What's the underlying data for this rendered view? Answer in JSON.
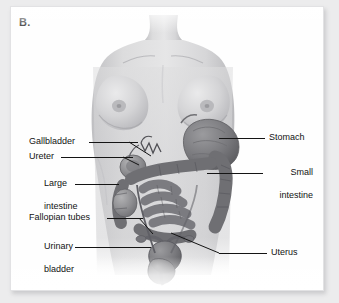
{
  "figure": {
    "panel_letter": "B.",
    "style": "grayscale-medical-illustration",
    "background_color": "#ececed",
    "panel_color": "#fefefe",
    "label_color": "#121212",
    "leader_color": "#141414"
  },
  "labels": {
    "left": [
      {
        "id": "gallbladder",
        "text": "Gallbladder"
      },
      {
        "id": "ureter",
        "text": "Ureter"
      },
      {
        "id": "large-intestine",
        "line1": "Large",
        "line2": "intestine"
      },
      {
        "id": "fallopian-tubes",
        "text": "Fallopian tubes"
      },
      {
        "id": "urinary-bladder",
        "line1": "Urinary",
        "line2": "bladder"
      }
    ],
    "right": [
      {
        "id": "stomach",
        "text": "Stomach"
      },
      {
        "id": "small-intestine",
        "line1": "Small",
        "line2": "intestine"
      },
      {
        "id": "uterus",
        "text": "Uterus"
      }
    ]
  }
}
